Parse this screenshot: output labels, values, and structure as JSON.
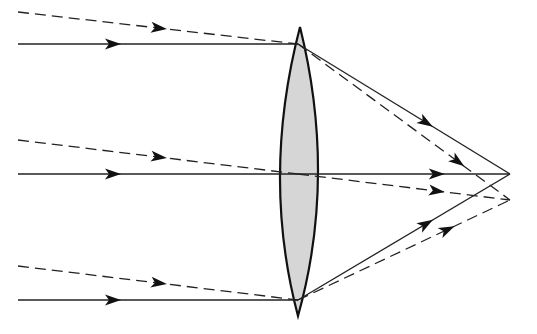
{
  "diagram": {
    "type": "ray-optics",
    "background": "#ffffff",
    "stroke_color": "#222222",
    "lens": {
      "shape": "biconvex",
      "fill": "#d6d6d6",
      "stroke": "#111111",
      "top_tip": [
        300,
        27
      ],
      "bottom_tip": [
        298,
        316
      ],
      "left_bulge_x": 280,
      "right_bulge_x": 318,
      "axis_y": 174
    },
    "ray_sets": [
      {
        "name": "axial-parallel-rays",
        "style": "solid",
        "focus": [
          510,
          174
        ],
        "rays": [
          {
            "start": [
              18,
              44
            ],
            "hit": [
              298,
              44
            ],
            "arrow_in": [
              112,
              44
            ],
            "arrow_out_t": 0.6
          },
          {
            "start": [
              18,
              174
            ],
            "hit": [
              298,
              174
            ],
            "arrow_in": [
              112,
              174
            ],
            "arrow_out_t": 0.65
          },
          {
            "start": [
              18,
              300
            ],
            "hit": [
              298,
              300
            ],
            "arrow_in": [
              112,
              300
            ],
            "arrow_out_t": 0.6
          }
        ]
      },
      {
        "name": "oblique-parallel-rays",
        "style": "dashed",
        "focus": [
          510,
          200
        ],
        "rays": [
          {
            "start": [
              18,
              12
            ],
            "hit": [
              298,
              44
            ],
            "arrow_in_t": 0.5,
            "arrow_out_t": 0.75
          },
          {
            "start": [
              18,
              140
            ],
            "hit": [
              298,
              174
            ],
            "arrow_in_t": 0.5,
            "arrow_out_t": 0.65
          },
          {
            "start": [
              18,
              266
            ],
            "hit": [
              298,
              300
            ],
            "arrow_in_t": 0.5,
            "arrow_out_t": 0.7
          }
        ]
      }
    ]
  }
}
